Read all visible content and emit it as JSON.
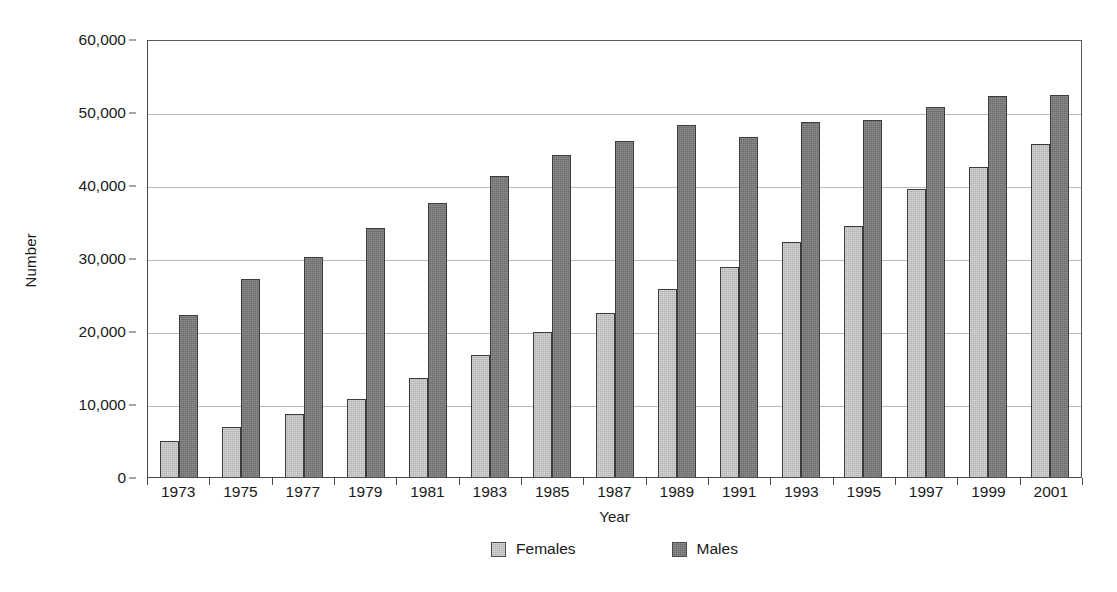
{
  "chart_data": {
    "type": "bar",
    "title": "",
    "xlabel": "Year",
    "ylabel": "Number",
    "ylim": [
      0,
      60000
    ],
    "ytick_step": 10000,
    "ytick_labels": [
      "0",
      "10,000",
      "20,000",
      "30,000",
      "40,000",
      "50,000",
      "60,000"
    ],
    "ytick_values": [
      0,
      10000,
      20000,
      30000,
      40000,
      50000,
      60000
    ],
    "grid": "horizontal",
    "legend_position": "bottom-center",
    "categories": [
      "1973",
      "1975",
      "1977",
      "1979",
      "1981",
      "1983",
      "1985",
      "1987",
      "1989",
      "1991",
      "1993",
      "1995",
      "1997",
      "1999",
      "2001"
    ],
    "series": [
      {
        "name": "Females",
        "color": "#b2b2b2",
        "values": [
          5000,
          6900,
          8700,
          10700,
          13500,
          16700,
          19900,
          22500,
          25800,
          28800,
          32200,
          34400,
          39500,
          42400,
          45600
        ]
      },
      {
        "name": "Males",
        "color": "#6b6b6b",
        "values": [
          22200,
          27100,
          30200,
          34100,
          37500,
          41200,
          44100,
          46000,
          48200,
          46600,
          48700,
          48900,
          50700,
          52200,
          52300
        ]
      }
    ]
  },
  "legend": {
    "entries": [
      {
        "label": "Females"
      },
      {
        "label": "Males"
      }
    ]
  }
}
